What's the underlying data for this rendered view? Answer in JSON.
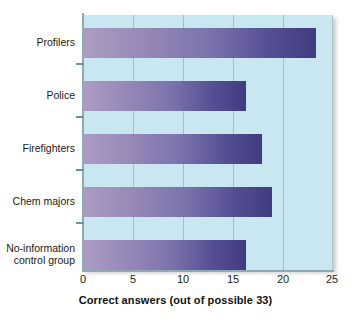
{
  "chart_data": {
    "type": "bar",
    "orientation": "horizontal",
    "title": "",
    "subtitle": "",
    "xlabel": "Correct answers (out of possible 33)",
    "ylabel": "",
    "categories": [
      "Profilers",
      "Police",
      "Firefighters",
      "Chem majors",
      "No-information control group"
    ],
    "values": [
      23.3,
      16.3,
      17.9,
      18.9,
      16.3
    ],
    "xlim": [
      0,
      25
    ],
    "xticks": [
      0,
      5,
      10,
      15,
      20,
      25
    ],
    "xtick_labels": [
      "0",
      "5",
      "10",
      "15",
      "20",
      "25"
    ],
    "grid": "vertical",
    "legend": "none",
    "bar_color_start": "#ab9dc2",
    "bar_color_end": "#413b82",
    "plot_background": "#c9e7f0",
    "axis_color": "#8fa9b5"
  },
  "labels": {
    "category_lines": [
      [
        "Profilers"
      ],
      [
        "Police"
      ],
      [
        "Firefighters"
      ],
      [
        "Chem majors"
      ],
      [
        "No-information",
        "control group"
      ]
    ]
  }
}
